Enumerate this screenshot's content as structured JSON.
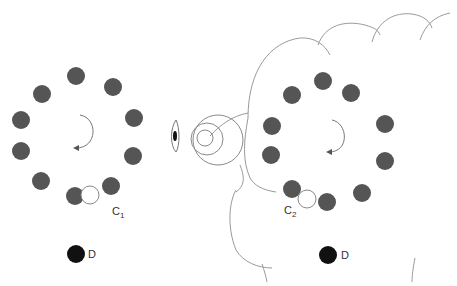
{
  "diagram": {
    "colors": {
      "dot": "#555555",
      "dot_dark": "#111111",
      "line": "#999999",
      "open_circle_stroke": "#888888"
    },
    "left_group": {
      "label_main": "C",
      "label_sub": "1",
      "detector_label": "D",
      "dots": [
        [
          76,
          76
        ],
        [
          42,
          94
        ],
        [
          113,
          87
        ],
        [
          21,
          120
        ],
        [
          134,
          118
        ],
        [
          21,
          151
        ],
        [
          133,
          156
        ],
        [
          41,
          181
        ],
        [
          111,
          186
        ],
        [
          75,
          196
        ]
      ],
      "open_circle": [
        90,
        195
      ],
      "rotation_arrow": "clockwise",
      "detector": [
        76,
        254
      ]
    },
    "right_group": {
      "label_main": "C",
      "label_sub": "2",
      "detector_label": "D",
      "dots": [
        [
          323,
          81
        ],
        [
          292,
          95
        ],
        [
          351,
          93
        ],
        [
          272,
          126
        ],
        [
          385,
          124
        ],
        [
          271,
          155
        ],
        [
          385,
          161
        ],
        [
          292,
          189
        ],
        [
          362,
          193
        ],
        [
          327,
          202
        ]
      ],
      "open_circle": [
        307,
        199
      ],
      "rotation_arrow": "clockwise",
      "detector": [
        328,
        255
      ]
    },
    "observer": {
      "icon": "eye-icon",
      "wave_rings": 3
    },
    "cloud": {
      "description": "scalloped cloud outline enclosing right group"
    }
  }
}
